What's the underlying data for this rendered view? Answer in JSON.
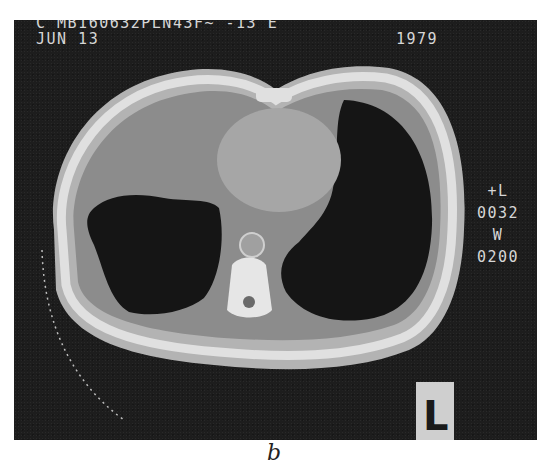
{
  "figure": {
    "caption": "b",
    "scan_overlay": {
      "header_line1": "C MB160632PLN43F~ -13 E",
      "header_date": "JUN 13",
      "header_year": "1979",
      "level_label": "+L",
      "level_value": "0032",
      "width_label": "W",
      "width_value": "0200",
      "orientation_marker": "L"
    },
    "colors": {
      "background": "#1d1d1d",
      "tissue": "#8f8f8f",
      "bone": "#dcdcdc",
      "lung": "#141414"
    }
  }
}
